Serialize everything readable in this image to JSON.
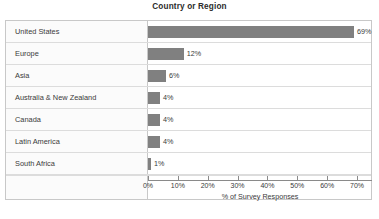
{
  "chart_data": {
    "type": "bar",
    "orientation": "horizontal",
    "title": "Country or Region",
    "xlabel": "% of Survey Responses",
    "ylabel": "",
    "categories": [
      "United States",
      "Europe",
      "Asia",
      "Australia & New Zealand",
      "Canada",
      "Latin America",
      "South Africa"
    ],
    "values": [
      69,
      12,
      6,
      4,
      4,
      4,
      1
    ],
    "value_labels": [
      "69%",
      "12%",
      "6%",
      "4%",
      "4%",
      "4%",
      "1%"
    ],
    "xlim": [
      0,
      75
    ],
    "xticks": [
      0,
      10,
      20,
      30,
      40,
      50,
      60,
      70
    ],
    "xtick_labels": [
      "0%",
      "10%",
      "20%",
      "30%",
      "40%",
      "50%",
      "60%",
      "70%"
    ],
    "grid": false,
    "legend": false,
    "bar_color": "#808080",
    "frame_color": "#c8c8c8",
    "row_divider_color": "#dcdcdc",
    "label_column_bg": "#fbfbfb",
    "text_color": "#3a3a3a"
  },
  "caption": {
    "text": ""
  }
}
